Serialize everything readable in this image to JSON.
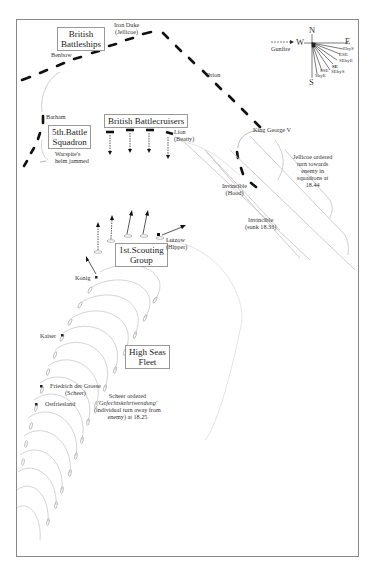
{
  "diagram": {
    "title_boxes": {
      "british_battleships": "British\nBattleships",
      "fifth_battle_squadron": "5th.Battle\nSquadron",
      "british_battlecruisers": "British Battlecruisers",
      "first_scouting_group": "1st.Scouting\nGroup",
      "high_seas_fleet": "High Seas\nFleet"
    },
    "ships": {
      "iron_duke": "Iron Duke",
      "jellicoe": "(Jellicoe)",
      "benbow": "Benbow",
      "orion": "Orion",
      "king_george_v": "King George V",
      "barham": "Barham",
      "lion": "Lion",
      "beatty": "(Beatty)",
      "invincible_hood": "Invincible",
      "hood": "(Hood)",
      "invincible_sunk": "Invincible",
      "sunk_time": "(sunk 18.33)",
      "lutzow": "Lutzow",
      "hipper": "(Hipper)",
      "konig": "Konig",
      "kaiser": "Kaiser",
      "friedrich": "Friedrich der Grosse",
      "scheer": "(Scheer)",
      "ostfriesland": "Ostfriesland"
    },
    "annotations": {
      "warspite_1": "Warspite's",
      "warspite_2": "helm jammed",
      "jellicoe_order_1": "Jellicoe ordered",
      "jellicoe_order_2": "turn towards",
      "jellicoe_order_3": "enemy in",
      "jellicoe_order_4": "squadrons at",
      "jellicoe_order_5": "18.44",
      "scheer_order_1": "Scheer ordered",
      "scheer_order_2": "'Gefechtskehrtwendung'",
      "scheer_order_3": "(individual turn away from",
      "scheer_order_4": "enemy) at 18.25"
    },
    "compass": {
      "north": "N",
      "south": "S",
      "east": "E",
      "west": "W",
      "gunfire": "Gunfire",
      "bearings": [
        "EbyS",
        "ESE",
        "SEbyE",
        "SE",
        "SEbyS",
        "SSE",
        "SbyE"
      ]
    },
    "colors": {
      "british_ships": "#111111",
      "german_tracks": "#bbbbbb",
      "frame": "#888888"
    }
  }
}
